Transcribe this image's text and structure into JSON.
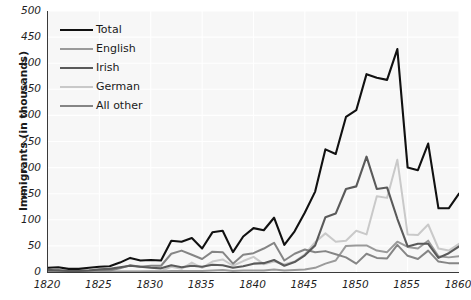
{
  "chart_data": {
    "type": "line",
    "title": "",
    "xlabel": "",
    "ylabel": "Immigrants (in thousands)",
    "xlim": [
      1820,
      1860
    ],
    "ylim": [
      0,
      500
    ],
    "grid": true,
    "legend_position": "top-left",
    "x": [
      1820,
      1821,
      1822,
      1823,
      1824,
      1825,
      1826,
      1827,
      1828,
      1829,
      1830,
      1831,
      1832,
      1833,
      1834,
      1835,
      1836,
      1837,
      1838,
      1839,
      1840,
      1841,
      1842,
      1843,
      1844,
      1845,
      1846,
      1847,
      1848,
      1849,
      1850,
      1851,
      1852,
      1853,
      1854,
      1855,
      1856,
      1857,
      1858,
      1859,
      1860
    ],
    "xticks": [
      1820,
      1825,
      1830,
      1835,
      1840,
      1845,
      1850,
      1855,
      1860
    ],
    "yticks": [
      0,
      50,
      100,
      150,
      200,
      250,
      300,
      350,
      400,
      450,
      500
    ],
    "series": [
      {
        "name": "Total",
        "color": "#111111",
        "width": 2.1,
        "values": [
          8,
          9,
          6,
          6,
          8,
          10,
          11,
          18,
          27,
          22,
          23,
          22,
          60,
          58,
          65,
          45,
          76,
          79,
          38,
          68,
          84,
          80,
          104,
          52,
          78,
          114,
          154,
          235,
          226,
          297,
          310,
          379,
          372,
          368,
          427,
          200,
          195,
          246,
          122,
          122,
          150
        ]
      },
      {
        "name": "English",
        "color": "#9a9a9a",
        "width": 2.0,
        "values": [
          1,
          1,
          1,
          1,
          1,
          1,
          1,
          1,
          1,
          1,
          1,
          1,
          2,
          2,
          2,
          2,
          3,
          4,
          2,
          3,
          3,
          3,
          5,
          3,
          4,
          5,
          8,
          16,
          22,
          50,
          51,
          51,
          41,
          38,
          58,
          48,
          45,
          60,
          30,
          28,
          30
        ]
      },
      {
        "name": "Irish",
        "color": "#5a5a5a",
        "width": 2.1,
        "values": [
          4,
          3,
          2,
          2,
          3,
          5,
          6,
          9,
          12,
          10,
          8,
          7,
          13,
          9,
          12,
          10,
          14,
          13,
          8,
          11,
          16,
          17,
          23,
          12,
          19,
          32,
          51,
          105,
          112,
          159,
          164,
          221,
          159,
          162,
          102,
          49,
          54,
          54,
          27,
          36,
          49
        ]
      },
      {
        "name": "German",
        "color": "#c9c9c9",
        "width": 2.0,
        "values": [
          1,
          1,
          1,
          1,
          1,
          1,
          1,
          1,
          1,
          1,
          2,
          2,
          10,
          6,
          18,
          8,
          20,
          24,
          12,
          21,
          29,
          15,
          20,
          15,
          20,
          34,
          57,
          74,
          58,
          60,
          79,
          72,
          145,
          142,
          215,
          72,
          71,
          91,
          45,
          41,
          54
        ]
      },
      {
        "name": "All other",
        "color": "#858585",
        "width": 2.0,
        "values": [
          2,
          4,
          2,
          2,
          3,
          3,
          3,
          7,
          13,
          10,
          12,
          12,
          35,
          41,
          33,
          25,
          39,
          38,
          16,
          33,
          36,
          45,
          56,
          22,
          35,
          43,
          38,
          40,
          34,
          28,
          16,
          35,
          27,
          26,
          52,
          31,
          25,
          41,
          20,
          17,
          17
        ]
      }
    ]
  },
  "axes": {
    "y_title": "Immigrants (in thousands)",
    "y_tick_labels": [
      "0",
      "50",
      "100",
      "150",
      "200",
      "250",
      "300",
      "350",
      "400",
      "450",
      "500"
    ],
    "x_tick_labels": [
      "1820",
      "1825",
      "1830",
      "1835",
      "1840",
      "1845",
      "1850",
      "1855",
      "1860"
    ]
  },
  "legend": {
    "items": [
      {
        "label": "Total"
      },
      {
        "label": "English"
      },
      {
        "label": "Irish"
      },
      {
        "label": "German"
      },
      {
        "label": "All other"
      }
    ]
  },
  "style": {
    "plot_background": "#f7f7f7",
    "page_background": "#ffffff",
    "grid_color": "#ffffff",
    "axis_color": "#3a3a3a",
    "text_color": "#1a1a1a"
  }
}
